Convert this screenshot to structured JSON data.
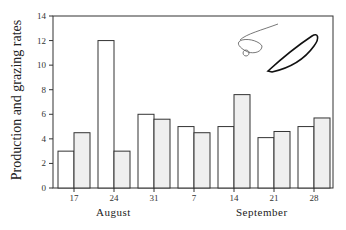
{
  "chart_data": {
    "type": "bar",
    "title": "",
    "xlabel": "",
    "ylabel": "Production and grazing rates",
    "ylim": [
      0,
      14
    ],
    "yticks": [
      0,
      2,
      4,
      6,
      8,
      10,
      12,
      14
    ],
    "categories": [
      "17",
      "24",
      "31",
      "7",
      "14",
      "21",
      "28"
    ],
    "month_labels": [
      {
        "label": "August",
        "spans": [
          "17",
          "24",
          "31"
        ]
      },
      {
        "label": "September",
        "spans": [
          "7",
          "14",
          "21",
          "28"
        ]
      }
    ],
    "series": [
      {
        "name": "Production",
        "fill": "#ffffff",
        "values": [
          3.0,
          12.0,
          6.0,
          5.0,
          5.0,
          4.1,
          5.0
        ]
      },
      {
        "name": "Grazing",
        "fill": "#efefef",
        "values": [
          4.5,
          3.0,
          5.6,
          4.5,
          7.6,
          4.6,
          5.7
        ]
      }
    ],
    "grid": false,
    "legend": "none (inset drawings of a zooplankter and a diatom cell at upper right)"
  },
  "axis": {
    "ylabel": "Production and grazing rates",
    "month1": "August",
    "month2": "September"
  },
  "colors": {
    "stroke": "#333333",
    "production_fill": "#ffffff",
    "grazing_fill": "#efefef"
  }
}
